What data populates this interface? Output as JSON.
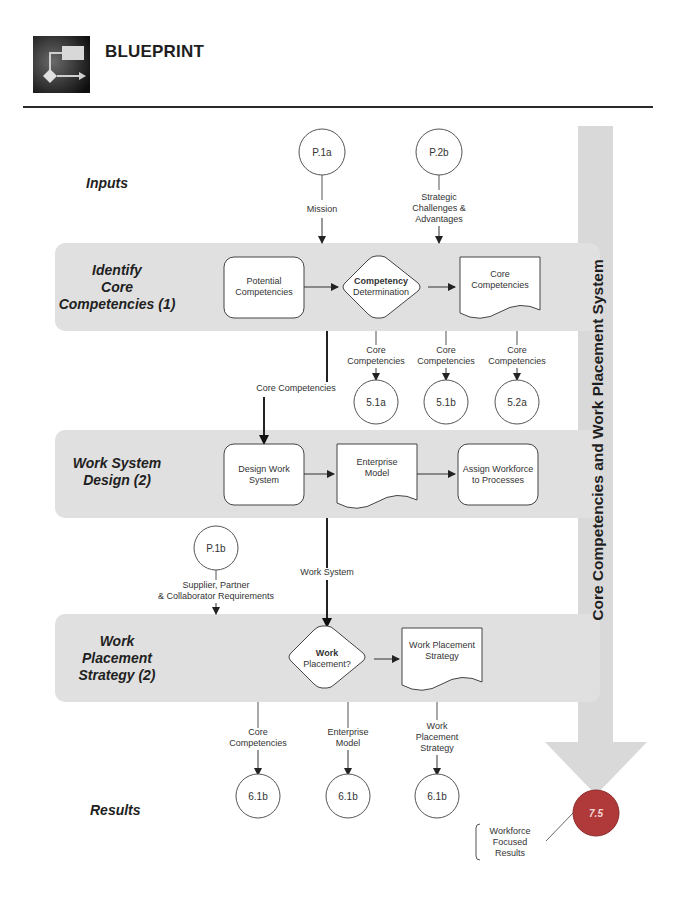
{
  "header": {
    "title": "BLUEPRINT",
    "logo_icon": "flowchart-icon"
  },
  "side_bar": {
    "label": "Core Competencies and Work Placement System",
    "color": "#d9d9d9"
  },
  "rows": {
    "inputs": {
      "label": "Inputs"
    },
    "identify": {
      "line1": "Identify",
      "line2": "Core",
      "line3": "Competencies (1)"
    },
    "work_system": {
      "line1": "Work System",
      "line2": "Design (2)"
    },
    "placement": {
      "line1": "Work",
      "line2": "Placement",
      "line3": "Strategy (2)"
    },
    "results": {
      "label": "Results"
    }
  },
  "inputs": {
    "p1a": {
      "id": "P.1a",
      "flow_label": "Mission"
    },
    "p2b": {
      "id": "P.2b",
      "flow_line1": "Strategic",
      "flow_line2": "Challenges &",
      "flow_line3": "Advantages"
    },
    "p1b": {
      "id": "P.1b",
      "flow_line1": "Supplier, Partner",
      "flow_line2": "& Collaborator Requirements"
    }
  },
  "identify_nodes": {
    "potential": {
      "line1": "Potential",
      "line2": "Competencies"
    },
    "decision": {
      "line1": "Competency",
      "line2": "Determination"
    },
    "core_doc": {
      "line1": "Core",
      "line2": "Competencies"
    }
  },
  "identify_outputs": [
    {
      "line1": "Core",
      "line2": "Competencies",
      "target": "5.1a"
    },
    {
      "line1": "Core",
      "line2": "Competencies",
      "target": "5.1b"
    },
    {
      "line1": "Core",
      "line2": "Competencies",
      "target": "5.2a"
    }
  ],
  "flows": {
    "core_to_design": "Core Competencies",
    "work_system": "Work System"
  },
  "work_system_nodes": {
    "design": {
      "line1": "Design Work",
      "line2": "System"
    },
    "enterprise": {
      "line1": "Enterprise",
      "line2": "Model"
    },
    "assign": {
      "line1": "Assign Workforce",
      "line2": "to Processes"
    }
  },
  "placement_nodes": {
    "decision": {
      "line1": "Work",
      "line2": "Placement?"
    },
    "strategy_doc": {
      "line1": "Work Placement",
      "line2": "Strategy"
    }
  },
  "results": [
    {
      "line1": "Core",
      "line2": "Competencies",
      "line3": "",
      "target": "6.1b"
    },
    {
      "line1": "Enterprise",
      "line2": "Model",
      "line3": "",
      "target": "6.1b"
    },
    {
      "line1": "Work",
      "line2": "Placement",
      "line3": "Strategy",
      "target": "6.1b"
    }
  ],
  "final": {
    "id": "7.5",
    "color": "#b03a3a",
    "callout_line1": "Workforce",
    "callout_line2": "Focused",
    "callout_line3": "Results"
  }
}
